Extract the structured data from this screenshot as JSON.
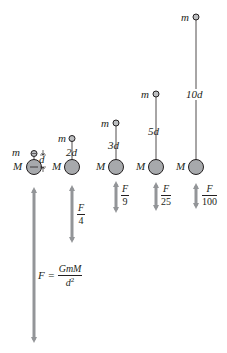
{
  "diagram": {
    "colors": {
      "large_mass_fill": "#a7a9ac",
      "large_mass_stroke": "#231f20",
      "small_mass_fill": "#bcbec0",
      "force_arrow": "#939598",
      "text": "#231f20"
    },
    "columns": [
      {
        "id": "d1",
        "small_mass_label": "m",
        "large_mass_label": "M",
        "distance_label": "d",
        "force_label": {
          "numerator": "F",
          "denominator": ""
        },
        "formula": {
          "lhs": "F =",
          "numerator": "GmM",
          "denominator": "d",
          "exponent": "2"
        }
      },
      {
        "id": "d2",
        "small_mass_label": "m",
        "large_mass_label": "M",
        "distance_label": "2d",
        "force_label": {
          "numerator": "F",
          "denominator": "4"
        }
      },
      {
        "id": "d3",
        "small_mass_label": "m",
        "large_mass_label": "M",
        "distance_label": "3d",
        "force_label": {
          "numerator": "F",
          "denominator": "9"
        }
      },
      {
        "id": "d5",
        "small_mass_label": "m",
        "large_mass_label": "M",
        "distance_label": "5d",
        "force_label": {
          "numerator": "F",
          "denominator": "25"
        }
      },
      {
        "id": "d10",
        "small_mass_label": "m",
        "large_mass_label": "M",
        "distance_label": "10d",
        "force_label": {
          "numerator": "F",
          "denominator": "100"
        }
      }
    ]
  }
}
